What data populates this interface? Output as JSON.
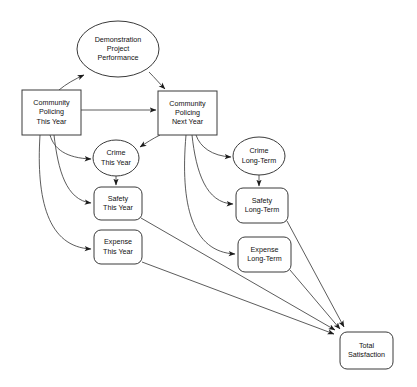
{
  "diagram": {
    "background_color": "#ffffff",
    "node_fill": "#ffffff",
    "node_stroke": "#3a3a3a",
    "edge_color": "#4a4a4a",
    "text_color": "#111111",
    "nodes": [
      {
        "id": "demonstration-project-performance",
        "shape": "ellipse",
        "lines": [
          "Demonstration",
          "Project",
          "Performance"
        ],
        "cx": 118,
        "cy": 49,
        "rx": 41,
        "ry": 28
      },
      {
        "id": "community-policing-this-year",
        "shape": "rect",
        "lines": [
          "Community",
          "Policing",
          "This Year"
        ],
        "x": 22,
        "y": 90,
        "w": 59,
        "h": 45
      },
      {
        "id": "community-policing-next-year",
        "shape": "rect",
        "lines": [
          "Community",
          "Policing",
          "Next Year"
        ],
        "x": 158,
        "y": 91,
        "w": 59,
        "h": 44
      },
      {
        "id": "crime-this-year",
        "shape": "ellipse",
        "lines": [
          "Crime",
          "This Year"
        ],
        "cx": 116,
        "cy": 158,
        "rx": 23,
        "ry": 18
      },
      {
        "id": "safety-this-year",
        "shape": "roundrect",
        "lines": [
          "Safety",
          "This Year"
        ],
        "x": 94,
        "y": 187,
        "w": 48,
        "h": 33
      },
      {
        "id": "expense-this-year",
        "shape": "roundrect",
        "lines": [
          "Expense",
          "This Year"
        ],
        "x": 94,
        "y": 230,
        "w": 48,
        "h": 34
      },
      {
        "id": "crime-long-term",
        "shape": "ellipse",
        "lines": [
          "Crime",
          "Long-Term"
        ],
        "cx": 259,
        "cy": 156,
        "rx": 26,
        "ry": 19
      },
      {
        "id": "safety-long-term",
        "shape": "roundrect",
        "lines": [
          "Safety",
          "Long-Term"
        ],
        "x": 236,
        "y": 188,
        "w": 52,
        "h": 35
      },
      {
        "id": "expense-long-term",
        "shape": "roundrect",
        "lines": [
          "Expense",
          "Long-Term"
        ],
        "x": 238,
        "y": 237,
        "w": 53,
        "h": 35
      },
      {
        "id": "total-satisfaction",
        "shape": "roundrect",
        "lines": [
          "Total",
          "Satisfaction"
        ],
        "x": 340,
        "y": 332,
        "w": 53,
        "h": 37
      }
    ],
    "edges": [
      {
        "id": "edge-cp-this-year-to-demo",
        "from": "community-policing-this-year",
        "to": "demonstration-project-performance",
        "d": "M 59,90 C 66,84 75,79 84,75",
        "arrow": true
      },
      {
        "id": "edge-demo-to-cp-next-year",
        "from": "demonstration-project-performance",
        "to": "community-policing-next-year",
        "d": "M 149,72 C 155,78 160,84 165,89",
        "arrow": true
      },
      {
        "id": "edge-cp-this-year-to-cp-next-year",
        "from": "community-policing-this-year",
        "to": "community-policing-next-year",
        "d": "M 81,110 L 156,110",
        "arrow": true
      },
      {
        "id": "edge-cp-this-year-to-crime-this-year",
        "from": "community-policing-this-year",
        "to": "crime-this-year",
        "d": "M 50,135 C 54,149 66,158 91,159",
        "arrow": true
      },
      {
        "id": "edge-cp-this-year-to-safety-this-year",
        "from": "community-policing-this-year",
        "to": "safety-this-year",
        "d": "M 54,135 C 58,170 66,200 91,203",
        "arrow": true
      },
      {
        "id": "edge-cp-this-year-to-expense-this-year",
        "from": "community-policing-this-year",
        "to": "expense-this-year",
        "d": "M 40,135 C 36,200 48,247 91,249",
        "arrow": true
      },
      {
        "id": "edge-crime-this-year-to-safety-this-year",
        "from": "crime-this-year",
        "to": "safety-this-year",
        "d": "M 116,176 L 116,185",
        "arrow": true
      },
      {
        "id": "edge-cp-next-year-to-crime-this-year",
        "from": "community-policing-next-year",
        "to": "crime-this-year",
        "d": "M 160,135 C 152,139 146,143 140,147",
        "arrow": true,
        "reverse": true
      },
      {
        "id": "edge-cp-next-year-to-crime-long-term",
        "from": "community-policing-next-year",
        "to": "crime-long-term",
        "d": "M 196,135 C 200,147 212,156 231,157",
        "arrow": true
      },
      {
        "id": "edge-cp-next-year-to-safety-long-term",
        "from": "community-policing-next-year",
        "to": "safety-long-term",
        "d": "M 192,135 C 196,172 206,203 233,204",
        "arrow": true
      },
      {
        "id": "edge-cp-next-year-to-expense-long-term",
        "from": "community-policing-next-year",
        "to": "expense-long-term",
        "d": "M 186,135 C 180,205 192,252 235,254",
        "arrow": true
      },
      {
        "id": "edge-crime-long-term-to-safety-long-term",
        "from": "crime-long-term",
        "to": "safety-long-term",
        "d": "M 259,175 L 259,186",
        "arrow": true
      },
      {
        "id": "edge-safety-this-year-to-total-satisfaction",
        "from": "safety-this-year",
        "to": "total-satisfaction",
        "d": "M 141,218 L 335,330",
        "arrow": true
      },
      {
        "id": "edge-expense-this-year-to-total-satisfaction",
        "from": "expense-this-year",
        "to": "total-satisfaction",
        "d": "M 142,262 L 334,334",
        "arrow": true
      },
      {
        "id": "edge-safety-long-term-to-total-satisfaction",
        "from": "safety-long-term",
        "to": "total-satisfaction",
        "d": "M 287,221 L 344,327",
        "arrow": true
      },
      {
        "id": "edge-expense-long-term-to-total-satisfaction",
        "from": "expense-long-term",
        "to": "total-satisfaction",
        "d": "M 290,270 L 340,329",
        "arrow": true
      }
    ]
  }
}
